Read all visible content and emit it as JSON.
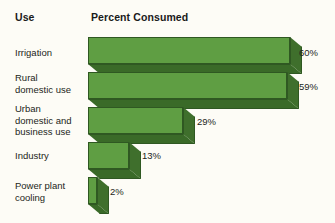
{
  "header": {
    "use_label": "Use",
    "percent_label": "Percent Consumed"
  },
  "colors": {
    "background": "#fdfcf6",
    "bar_front": "#5f9e43",
    "bar_side": "#3f6f2c",
    "bar_bottom": "#3a6a28",
    "bar_outline": "#2f5822",
    "text": "#231f20"
  },
  "chart_data": {
    "type": "bar",
    "title": "Percent Consumed",
    "xlabel": "Percent Consumed",
    "ylabel": "Use",
    "orientation": "horizontal",
    "grid": false,
    "legend": false,
    "xlim": [
      0,
      60
    ],
    "categories": [
      "Irrigation",
      "Rural\ndomestic use",
      "Urban\ndomestic and\nbusiness use",
      "Industry",
      "Power plant\ncooling"
    ],
    "values": [
      60,
      59,
      29,
      13,
      2
    ],
    "value_labels": [
      "60%",
      "59%",
      "29%",
      "13%",
      "2%"
    ]
  },
  "rows": [
    {
      "label": "Irrigation",
      "value": 60,
      "value_label": "60%",
      "label_top": 47,
      "bar_top": 37,
      "bar_width": 202,
      "bar_height": 27,
      "value_left": 299,
      "value_top": 47
    },
    {
      "label": "Rural\ndomestic use",
      "value": 59,
      "value_label": "59%",
      "label_top": 72,
      "bar_top": 72,
      "bar_width": 199,
      "bar_height": 27,
      "value_left": 299,
      "value_top": 81
    },
    {
      "label": "Urban\ndomestic and\nbusiness use",
      "value": 29,
      "value_label": "29%",
      "label_top": 103,
      "bar_top": 107,
      "bar_width": 95,
      "bar_height": 27,
      "value_left": 197,
      "value_top": 116
    },
    {
      "label": "Industry",
      "value": 13,
      "value_label": "13%",
      "label_top": 150,
      "bar_top": 142,
      "bar_width": 41,
      "bar_height": 27,
      "value_left": 142,
      "value_top": 150
    },
    {
      "label": "Power plant\ncooling",
      "value": 2,
      "value_label": "2%",
      "label_top": 180,
      "bar_top": 177,
      "bar_width": 9,
      "bar_height": 27,
      "value_left": 110,
      "value_top": 186
    }
  ]
}
